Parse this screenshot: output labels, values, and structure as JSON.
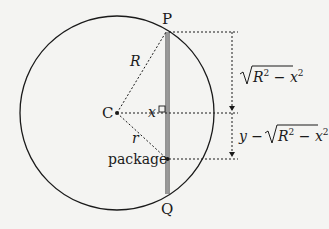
{
  "diagram": {
    "labels": {
      "top_point": "P",
      "bottom_point": "Q",
      "center": "C",
      "big_radius": "R",
      "small_radius": "r",
      "distance": "x",
      "package": "package",
      "upper_measure": "√(R² − x²)",
      "lower_measure": "y − √(R² − x²)"
    },
    "upper_sqrt_body": "R",
    "upper_sqrt_exp1": "2",
    "upper_sqrt_minus": " − x",
    "upper_sqrt_exp2": "2",
    "lower_prefix": "y −",
    "colors": {
      "stroke": "#1a1a1a",
      "background": "#f4f4f2",
      "chord": "#8a8a8a"
    }
  }
}
